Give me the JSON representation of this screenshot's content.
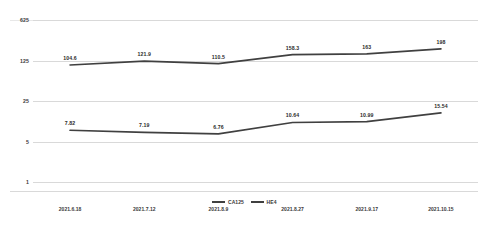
{
  "chart_data": {
    "type": "line",
    "title": "",
    "subtitle": "",
    "xlabel": "",
    "ylabel": "",
    "yscale": "log",
    "ylim": [
      1,
      625
    ],
    "yticks": [
      1,
      5,
      25,
      125,
      625
    ],
    "ytick_labels": [
      "1",
      "5",
      "25",
      "125",
      "625"
    ],
    "grid": true,
    "legend_position": "bottom",
    "categories": [
      "2021.6.18",
      "2021.7.12",
      "2021.8.9",
      "2021.8.27",
      "2021.9.17",
      "2021.10.15"
    ],
    "series": [
      {
        "name": "CA125",
        "color": "#404040",
        "values": [
          104.6,
          121.9,
          110.5,
          158.3,
          163,
          198
        ],
        "labels": [
          "104.6",
          "121.9",
          "110.5",
          "158.3",
          "163",
          "198"
        ]
      },
      {
        "name": "HE4",
        "color": "#404040",
        "values": [
          7.82,
          7.19,
          6.76,
          10.64,
          10.99,
          15.54
        ],
        "labels": [
          "7.82",
          "7.19",
          "6.76",
          "10.64",
          "10.99",
          "15.54"
        ]
      }
    ]
  },
  "legend": {
    "items": [
      {
        "label": "CA125"
      },
      {
        "label": "HE4"
      }
    ]
  }
}
